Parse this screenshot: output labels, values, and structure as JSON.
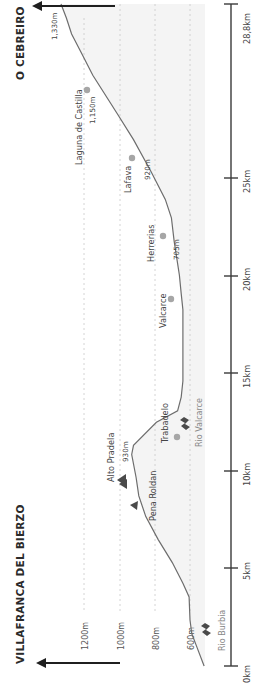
{
  "chart_data": {
    "type": "line",
    "orientation": "rotated-90ccw",
    "title_start": "VILLAFRANCA DEL BIERZO",
    "title_end": "O CEBREIRO",
    "xlabel": "Distance (km)",
    "ylabel": "Elevation (m)",
    "x_ticks": [
      {
        "km": 0,
        "label": "0km"
      },
      {
        "km": 5,
        "label": "5km"
      },
      {
        "km": 10,
        "label": "10km"
      },
      {
        "km": 15,
        "label": "15km"
      },
      {
        "km": 20,
        "label": "20km"
      },
      {
        "km": 25,
        "label": "25km"
      },
      {
        "km": 28.8,
        "label": "28,8km"
      }
    ],
    "y_ticks": [
      {
        "m": 600,
        "label": "600m"
      },
      {
        "m": 800,
        "label": "800m"
      },
      {
        "m": 1000,
        "label": "1000m"
      },
      {
        "m": 1200,
        "label": "1200m"
      }
    ],
    "xlim": [
      0,
      28.8
    ],
    "ylim": [
      500,
      1350
    ],
    "grid": true,
    "profile": [
      {
        "km": 0.0,
        "m": 520
      },
      {
        "km": 0.8,
        "m": 560
      },
      {
        "km": 1.4,
        "m": 590
      },
      {
        "km": 2.0,
        "m": 600
      },
      {
        "km": 3.0,
        "m": 605
      },
      {
        "km": 3.6,
        "m": 640
      },
      {
        "km": 4.5,
        "m": 700
      },
      {
        "km": 5.5,
        "m": 780
      },
      {
        "km": 6.5,
        "m": 850
      },
      {
        "km": 7.4,
        "m": 890
      },
      {
        "km": 8.2,
        "m": 905
      },
      {
        "km": 9.2,
        "m": 930
      },
      {
        "km": 9.6,
        "m": 920
      },
      {
        "km": 10.6,
        "m": 790
      },
      {
        "km": 11.1,
        "m": 670
      },
      {
        "km": 11.7,
        "m": 650
      },
      {
        "km": 12.4,
        "m": 640
      },
      {
        "km": 14.0,
        "m": 640
      },
      {
        "km": 15.5,
        "m": 640
      },
      {
        "km": 16.2,
        "m": 650
      },
      {
        "km": 17.0,
        "m": 660
      },
      {
        "km": 18.5,
        "m": 690
      },
      {
        "km": 19.5,
        "m": 705
      },
      {
        "km": 20.3,
        "m": 740
      },
      {
        "km": 21.5,
        "m": 820
      },
      {
        "km": 22.9,
        "m": 920
      },
      {
        "km": 24.0,
        "m": 1010
      },
      {
        "km": 25.7,
        "m": 1150
      },
      {
        "km": 26.6,
        "m": 1210
      },
      {
        "km": 27.5,
        "m": 1270
      },
      {
        "km": 28.2,
        "m": 1300
      },
      {
        "km": 28.8,
        "m": 1330
      }
    ],
    "waypoints": [
      {
        "name": "Rio Burbia",
        "km": 1.5,
        "m": 600,
        "marker": "river",
        "elev_label": ""
      },
      {
        "name": "Pena Roldan",
        "km": 7.9,
        "m": 900,
        "marker": "triangle",
        "elev_label": ""
      },
      {
        "name": "Alto Pradela",
        "km": 9.2,
        "m": 930,
        "marker": "peak",
        "elev_label": "930m"
      },
      {
        "name": "Trabadelo",
        "km": 10.8,
        "m": 700,
        "marker": "dot",
        "elev_label": ""
      },
      {
        "name": "Rio Valcarce",
        "km": 11.6,
        "m": 655,
        "marker": "river",
        "elev_label": ""
      },
      {
        "name": "Valcarce",
        "km": 17.2,
        "m": 665,
        "marker": "dot",
        "elev_label": ""
      },
      {
        "name": "Herrerias",
        "km": 19.5,
        "m": 705,
        "marker": "dot",
        "elev_label": "705m"
      },
      {
        "name": "Lafava",
        "km": 22.9,
        "m": 920,
        "marker": "dot",
        "elev_label": "920m"
      },
      {
        "name": "Laguna de Castilla",
        "km": 25.7,
        "m": 1150,
        "marker": "dot",
        "elev_label": "1,150m"
      },
      {
        "name": "O Cebreiro",
        "km": 28.8,
        "m": 1330,
        "marker": "end",
        "elev_label": "1,330m"
      }
    ]
  },
  "labels": {
    "start_town": "VILLAFRANCA DEL BIERZO",
    "end_town": "O CEBREIRO",
    "grid_600": "600m",
    "grid_800": "800m",
    "grid_1000": "1000m",
    "grid_1200": "1200m",
    "km_0": "0km",
    "km_5": "5km",
    "km_10": "10km",
    "km_15": "15km",
    "km_20": "20km",
    "km_25": "25km",
    "km_end": "28,8km",
    "wp_rio_burbia": "Rio Burbia",
    "wp_pena_roldan": "Pena Roldan",
    "wp_alto_pradela": "Alto Pradela",
    "wp_alto_pradela_elev": "930m",
    "wp_trabadelo": "Trabadelo",
    "wp_rio_valcarce": "Rio Valcarce",
    "wp_valcarce": "Valcarce",
    "wp_herrerias": "Herrerias",
    "wp_herrerias_elev": "705m",
    "wp_lafava": "Lafava",
    "wp_lafava_elev": "920m",
    "wp_laguna": "Laguna de Castilla",
    "wp_laguna_elev": "1,150m",
    "wp_cebreiro_elev": "1,330m"
  },
  "colors": {
    "profile_line": "#6d6d6d",
    "marker_dot": "#a6a6a6",
    "grid": "#c9c9c9",
    "text": "#444444",
    "arrow": "#1f1f1f"
  }
}
